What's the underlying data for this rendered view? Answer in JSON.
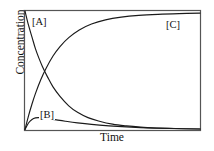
{
  "chart_data": {
    "type": "line",
    "title": "",
    "subtitle": "",
    "xlabel": "Time",
    "ylabel": "Concentration",
    "xlim": [
      0,
      1
    ],
    "ylim": [
      0,
      1
    ],
    "grid": false,
    "axis_ticks": false,
    "tick_labels": [],
    "legend_position": "inline-annotations",
    "annotations": [
      {
        "text": "[A]",
        "x": 0.04,
        "y": 0.93
      },
      {
        "text": "[B]",
        "x": 0.09,
        "y": 0.18
      },
      {
        "text": "[C]",
        "x": 0.8,
        "y": 0.92
      }
    ],
    "series": [
      {
        "name": "[A]",
        "label": "[A]",
        "color": "#1a1a1a",
        "description": "reactant exponential decay from maximum to zero",
        "x": [
          0.0,
          0.02,
          0.04,
          0.06,
          0.08,
          0.1,
          0.13,
          0.16,
          0.2,
          0.25,
          0.3,
          0.36,
          0.42,
          0.5,
          0.58,
          0.66,
          0.75,
          0.85,
          1.0
        ],
        "y": [
          1.0,
          0.88,
          0.78,
          0.68,
          0.6,
          0.53,
          0.44,
          0.36,
          0.28,
          0.2,
          0.145,
          0.1,
          0.072,
          0.045,
          0.03,
          0.02,
          0.013,
          0.008,
          0.004
        ]
      },
      {
        "name": "[B]",
        "label": "[B]",
        "color": "#1a1a1a",
        "description": "intermediate rises rapidly to a low maximum then slowly decays",
        "x": [
          0.0,
          0.02,
          0.04,
          0.06,
          0.08,
          0.11,
          0.14,
          0.18,
          0.23,
          0.3,
          0.38,
          0.48,
          0.58,
          0.7,
          0.82,
          1.0
        ],
        "y": [
          0.0,
          0.055,
          0.085,
          0.098,
          0.1,
          0.096,
          0.09,
          0.081,
          0.07,
          0.056,
          0.043,
          0.031,
          0.022,
          0.014,
          0.009,
          0.004
        ]
      },
      {
        "name": "[C]",
        "label": "[C]",
        "color": "#1a1a1a",
        "description": "product exponential rise to plateau at maximum",
        "x": [
          0.0,
          0.02,
          0.04,
          0.06,
          0.09,
          0.12,
          0.16,
          0.2,
          0.25,
          0.31,
          0.38,
          0.46,
          0.55,
          0.65,
          0.76,
          0.88,
          1.0
        ],
        "y": [
          0.0,
          0.115,
          0.215,
          0.305,
          0.42,
          0.515,
          0.62,
          0.7,
          0.775,
          0.84,
          0.89,
          0.925,
          0.948,
          0.963,
          0.972,
          0.978,
          0.982
        ]
      }
    ]
  },
  "figure": {
    "frame_color": "#555555",
    "line_color": "#1a1a1a",
    "background": "#ffffff"
  }
}
